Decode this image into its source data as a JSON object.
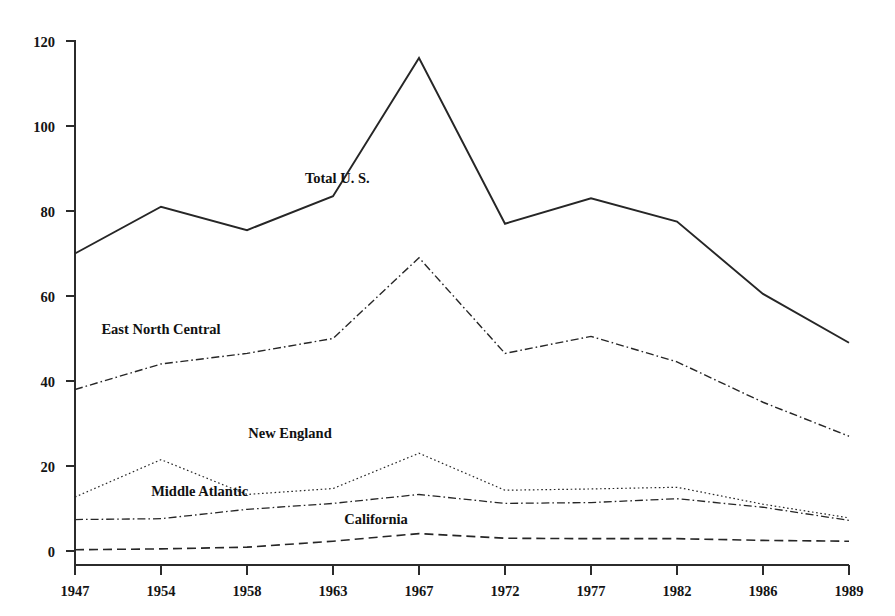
{
  "chart_data": {
    "type": "line",
    "title": "",
    "subtitle": "",
    "xlabel": "",
    "ylabel": "",
    "categories": [
      "1947",
      "1954",
      "1958",
      "1963",
      "1967",
      "1972",
      "1977",
      "1982",
      "1986",
      "1989"
    ],
    "x_tick_labels": [
      "1947",
      "1954",
      "1958",
      "1963",
      "1967",
      "1972",
      "1977",
      "1982",
      "1986",
      "1989"
    ],
    "y_tick_labels": [
      "0",
      "20",
      "40",
      "60",
      "80",
      "100",
      "120"
    ],
    "y_ticks": [
      0,
      20,
      40,
      60,
      80,
      100,
      120
    ],
    "ylim": [
      0,
      120
    ],
    "grid": false,
    "legend_position": "inline-labels",
    "series": [
      {
        "name": "Total U. S.",
        "label": "Total U. S.",
        "style": "solid",
        "color": "#262626",
        "width": 1.9,
        "label_x_index": 3.05,
        "label_y_value": 86.5,
        "values": [
          70,
          81,
          75.5,
          83.5,
          116,
          77,
          83,
          77.5,
          60.5,
          49
        ]
      },
      {
        "name": "East North Central",
        "label": "East North Central",
        "style": "dashdot",
        "color": "#262626",
        "width": 1.4,
        "label_x_index": 1.0,
        "label_y_value": 51,
        "values": [
          38,
          44,
          46.5,
          50,
          69,
          46.5,
          50.5,
          44.5,
          35,
          27
        ]
      },
      {
        "name": "New England",
        "label": "New England",
        "style": "dotted",
        "color": "#262626",
        "width": 1.2,
        "label_x_index": 2.5,
        "label_y_value": 26.5,
        "values": [
          12.7,
          21.5,
          13.3,
          14.7,
          23,
          14.3,
          14.6,
          15,
          11,
          7.8
        ]
      },
      {
        "name": "Middle Atlantic",
        "label": "Middle Atlantic",
        "style": "dashdot",
        "color": "#262626",
        "width": 1.3,
        "label_x_index": 1.45,
        "label_y_value": 13.0,
        "values": [
          7.4,
          7.6,
          9.8,
          11.2,
          13.3,
          11.2,
          11.4,
          12.3,
          10.3,
          7.2
        ]
      },
      {
        "name": "California",
        "label": "California",
        "style": "dashed",
        "color": "#262626",
        "width": 1.6,
        "label_x_index": 3.5,
        "label_y_value": 6.4,
        "values": [
          0.3,
          0.5,
          0.9,
          2.3,
          4.1,
          3.0,
          2.9,
          2.9,
          2.5,
          2.3
        ]
      }
    ]
  },
  "axes": {
    "y_axis_name": "y-axis",
    "x_axis_name": "x-axis"
  }
}
